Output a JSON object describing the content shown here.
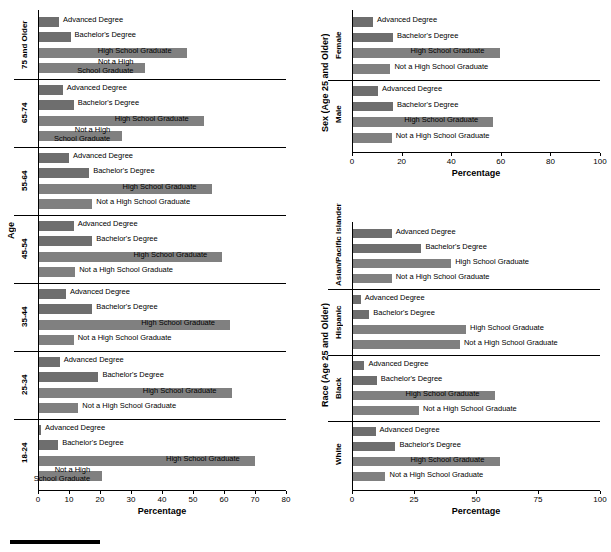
{
  "chart_data": [
    {
      "type": "bar",
      "id": "age-panel",
      "title": "",
      "xlabel": "Percentage",
      "ylabel": "Age",
      "xlim": [
        0,
        80
      ],
      "xticks": [
        0,
        10,
        20,
        30,
        40,
        50,
        60,
        70,
        80
      ],
      "orientation": "horizontal",
      "grid": false,
      "groups": [
        {
          "label": "75 and Older",
          "bars": [
            {
              "name": "Advanced Degree",
              "value": 6.8,
              "label_inside": false
            },
            {
              "name": "Bachelor's Degree",
              "value": 10.5,
              "label_inside": false
            },
            {
              "name": "High School Graduate",
              "value": 48.0,
              "label_inside": true
            },
            {
              "name": "Not a High School Graduate",
              "value": 34.5,
              "label_inside": true
            }
          ]
        },
        {
          "label": "65-74",
          "bars": [
            {
              "name": "Advanced Degree",
              "value": 8.0,
              "label_inside": false
            },
            {
              "name": "Bachelor's Degree",
              "value": 11.5,
              "label_inside": false
            },
            {
              "name": "High School Graduate",
              "value": 53.5,
              "label_inside": true
            },
            {
              "name": "Not a High School Graduate",
              "value": 27.0,
              "label_inside": true
            }
          ]
        },
        {
          "label": "55-64",
          "bars": [
            {
              "name": "Advanced Degree",
              "value": 10.0,
              "label_inside": false
            },
            {
              "name": "Bachelor's Degree",
              "value": 16.5,
              "label_inside": false
            },
            {
              "name": "High School Graduate",
              "value": 56.0,
              "label_inside": true
            },
            {
              "name": "Not a High School Graduate",
              "value": 17.5,
              "label_inside": false
            }
          ]
        },
        {
          "label": "45-54",
          "bars": [
            {
              "name": "Advanced Degree",
              "value": 11.5,
              "label_inside": false
            },
            {
              "name": "Bachelor's Degree",
              "value": 17.5,
              "label_inside": false
            },
            {
              "name": "High School Graduate",
              "value": 59.5,
              "label_inside": true
            },
            {
              "name": "Not a High School Graduate",
              "value": 12.0,
              "label_inside": false
            }
          ]
        },
        {
          "label": "35-44",
          "bars": [
            {
              "name": "Advanced Degree",
              "value": 9.0,
              "label_inside": false
            },
            {
              "name": "Bachelor's Degree",
              "value": 17.5,
              "label_inside": false
            },
            {
              "name": "High School Graduate",
              "value": 62.0,
              "label_inside": true
            },
            {
              "name": "Not a High School Graduate",
              "value": 11.5,
              "label_inside": false
            }
          ]
        },
        {
          "label": "25-34",
          "bars": [
            {
              "name": "Advanced Degree",
              "value": 7.0,
              "label_inside": false
            },
            {
              "name": "Bachelor's Degree",
              "value": 19.5,
              "label_inside": false
            },
            {
              "name": "High School Graduate",
              "value": 62.5,
              "label_inside": true
            },
            {
              "name": "Not a High School Graduate",
              "value": 13.0,
              "label_inside": false
            }
          ]
        },
        {
          "label": "18-24",
          "bars": [
            {
              "name": "Advanced Degree",
              "value": 1.0,
              "label_inside": false
            },
            {
              "name": "Bachelor's Degree",
              "value": 6.5,
              "label_inside": false
            },
            {
              "name": "High School Graduate",
              "value": 70.0,
              "label_inside": true
            },
            {
              "name": "Not a High School Graduate",
              "value": 20.5,
              "label_inside": true
            }
          ]
        }
      ]
    },
    {
      "type": "bar",
      "id": "sex-panel",
      "title": "",
      "xlabel": "Percentage",
      "ylabel": "Sex (Age 25 and Older)",
      "xlim": [
        0,
        100
      ],
      "xticks": [
        0,
        20,
        40,
        60,
        80,
        100
      ],
      "orientation": "horizontal",
      "grid": false,
      "groups": [
        {
          "label": "Female",
          "bars": [
            {
              "name": "Advanced Degree",
              "value": 8.5,
              "label_inside": false
            },
            {
              "name": "Bachelor's Degree",
              "value": 16.5,
              "label_inside": false
            },
            {
              "name": "High School Graduate",
              "value": 59.5,
              "label_inside": true
            },
            {
              "name": "Not a High School Graduate",
              "value": 15.5,
              "label_inside": false
            }
          ]
        },
        {
          "label": "Male",
          "bars": [
            {
              "name": "Advanced Degree",
              "value": 10.5,
              "label_inside": false
            },
            {
              "name": "Bachelor's Degree",
              "value": 16.5,
              "label_inside": false
            },
            {
              "name": "High School Graduate",
              "value": 57.0,
              "label_inside": true
            },
            {
              "name": "Not a High School Graduate",
              "value": 16.0,
              "label_inside": false
            }
          ]
        }
      ]
    },
    {
      "type": "bar",
      "id": "race-panel",
      "title": "",
      "xlabel": "Percentage",
      "ylabel": "Race (Age 25 and Older)",
      "xlim": [
        0,
        100
      ],
      "xticks": [
        0,
        25,
        50,
        75,
        100
      ],
      "orientation": "horizontal",
      "grid": false,
      "groups": [
        {
          "label": "Asian/Pacific Islander",
          "bars": [
            {
              "name": "Advanced Degree",
              "value": 16.0,
              "label_inside": false
            },
            {
              "name": "Bachelor's Degree",
              "value": 28.0,
              "label_inside": false
            },
            {
              "name": "High School Graduate",
              "value": 40.0,
              "label_inside": false
            },
            {
              "name": "Not a High School Graduate",
              "value": 16.0,
              "label_inside": false
            }
          ]
        },
        {
          "label": "Hispanic",
          "bars": [
            {
              "name": "Advanced Degree",
              "value": 3.5,
              "label_inside": false
            },
            {
              "name": "Bachelor's Degree",
              "value": 7.0,
              "label_inside": false
            },
            {
              "name": "High School Graduate",
              "value": 46.0,
              "label_inside": false
            },
            {
              "name": "Not a High School Graduate",
              "value": 43.5,
              "label_inside": false
            }
          ]
        },
        {
          "label": "Black",
          "bars": [
            {
              "name": "Advanced Degree",
              "value": 5.0,
              "label_inside": false
            },
            {
              "name": "Bachelor's Degree",
              "value": 10.0,
              "label_inside": false
            },
            {
              "name": "High School Graduate",
              "value": 57.5,
              "label_inside": true
            },
            {
              "name": "Not a High School Graduate",
              "value": 27.0,
              "label_inside": false
            }
          ]
        },
        {
          "label": "White",
          "bars": [
            {
              "name": "Advanced Degree",
              "value": 9.5,
              "label_inside": false
            },
            {
              "name": "Bachelor's Degree",
              "value": 17.5,
              "label_inside": false
            },
            {
              "name": "High School Graduate",
              "value": 59.5,
              "label_inside": true
            },
            {
              "name": "Not a High School Graduate",
              "value": 13.5,
              "label_inside": false
            }
          ]
        }
      ]
    }
  ],
  "colors": {
    "bar": "#808080",
    "bar_dark": "#6e6e6e",
    "axis": "#000000",
    "background": "#ffffff"
  }
}
